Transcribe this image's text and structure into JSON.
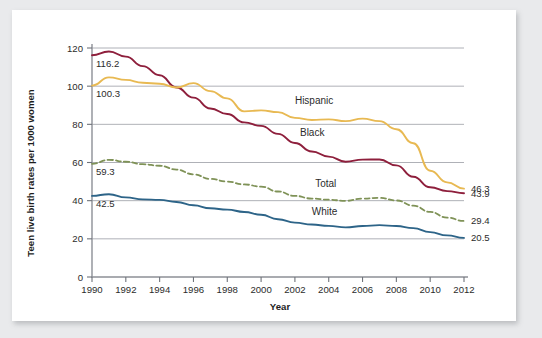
{
  "chart_data": {
    "type": "line",
    "title": "",
    "xlabel": "Year",
    "ylabel": "Teen live birth rates per 1000 women",
    "xlim": [
      1990,
      2012
    ],
    "ylim": [
      0,
      120
    ],
    "grid": true,
    "legend_position": "inline-right-of-series",
    "x": [
      1990,
      1991,
      1992,
      1993,
      1994,
      1995,
      1996,
      1997,
      1998,
      1999,
      2000,
      2001,
      2002,
      2003,
      2004,
      2005,
      2006,
      2007,
      2008,
      2009,
      2010,
      2011,
      2012
    ],
    "y_ticks": [
      0,
      20,
      40,
      60,
      80,
      100,
      120
    ],
    "x_ticks": [
      1990,
      1992,
      1994,
      1996,
      1998,
      2000,
      2002,
      2004,
      2006,
      2008,
      2010,
      2012
    ],
    "x_tick_labels": [
      "1990",
      "1992",
      "1994",
      "1996",
      "1998",
      "2000",
      "2002",
      "2004",
      "2006",
      "2008",
      "2010",
      "2012"
    ],
    "y_tick_labels": [
      "0",
      "20",
      "40",
      "60",
      "80",
      "100",
      "120"
    ],
    "series": [
      {
        "name": "Black",
        "label": "Black",
        "color": "#8e1f3c",
        "dashed": false,
        "start_value_label": "116.2",
        "end_value_label": "43.9",
        "values": [
          116.2,
          118.2,
          115.5,
          110.5,
          105.7,
          99.3,
          94.0,
          88.3,
          85.4,
          81.0,
          79.2,
          75.0,
          70.2,
          65.8,
          63.1,
          60.4,
          61.5,
          61.6,
          58.5,
          52.5,
          47.0,
          45.0,
          43.9
        ]
      },
      {
        "name": "Hispanic",
        "label": "Hispanic",
        "color": "#e8b952",
        "dashed": false,
        "start_value_label": "100.3",
        "end_value_label": "46.3",
        "values": [
          100.3,
          104.6,
          103.3,
          101.8,
          101.3,
          99.3,
          101.6,
          97.4,
          93.6,
          86.8,
          87.3,
          86.4,
          83.4,
          82.3,
          82.6,
          81.7,
          83.0,
          81.7,
          77.4,
          70.1,
          55.7,
          49.6,
          46.3
        ]
      },
      {
        "name": "Total",
        "label": "Total",
        "color": "#7f9257",
        "dashed": true,
        "start_value_label": "59.3",
        "end_value_label": "29.4",
        "values": [
          59.3,
          61.4,
          60.4,
          59.1,
          58.3,
          56.3,
          53.8,
          51.4,
          50.0,
          48.5,
          47.4,
          44.8,
          42.5,
          41.1,
          40.5,
          39.9,
          41.1,
          41.5,
          40.1,
          37.4,
          34.1,
          31.1,
          29.4
        ]
      },
      {
        "name": "White",
        "label": "White",
        "color": "#2d6488",
        "dashed": false,
        "start_value_label": "42.5",
        "end_value_label": "20.5",
        "values": [
          42.5,
          43.4,
          41.7,
          40.7,
          40.4,
          39.3,
          37.6,
          36.0,
          35.3,
          34.1,
          32.6,
          30.3,
          28.5,
          27.5,
          26.8,
          26.0,
          26.7,
          27.2,
          26.7,
          25.6,
          23.5,
          21.8,
          20.5
        ]
      }
    ],
    "series_annotations": [
      {
        "series": "Hispanic",
        "text": "Hispanic",
        "at_year": 2002,
        "at_value": 90.5
      },
      {
        "series": "Black",
        "text": "Black",
        "at_year": 2002.3,
        "at_value": 74.0
      },
      {
        "series": "Total",
        "text": "Total",
        "at_year": 2003.2,
        "at_value": 47.0
      },
      {
        "series": "White",
        "text": "White",
        "at_year": 2003.0,
        "at_value": 32.5
      }
    ],
    "left_value_labels": [
      {
        "series": "Black",
        "text": "116.2"
      },
      {
        "series": "Hispanic",
        "text": "100.3"
      },
      {
        "series": "Total",
        "text": "59.3"
      },
      {
        "series": "White",
        "text": "42.5"
      }
    ],
    "right_value_labels": [
      {
        "series": "Hispanic",
        "text": "46.3"
      },
      {
        "series": "Black",
        "text": "43.9"
      },
      {
        "series": "Total",
        "text": "29.4"
      },
      {
        "series": "White",
        "text": "20.5"
      }
    ]
  }
}
